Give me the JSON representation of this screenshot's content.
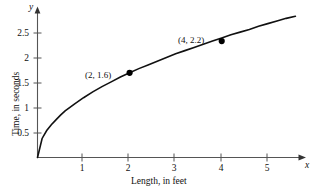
{
  "chart_data": {
    "type": "line",
    "title": "",
    "subtitle": "",
    "xlabel": "Length, in feet",
    "ylabel": "Time, in seconds",
    "x_axis_name": "x",
    "y_axis_name": "y",
    "xlim": [
      0,
      5.7
    ],
    "ylim": [
      0,
      2.75
    ],
    "grid": false,
    "legend": false,
    "xticks": [
      1,
      2,
      3,
      4,
      5
    ],
    "xtick_labels": [
      "1",
      "2",
      "3",
      "4",
      "5"
    ],
    "yticks": [
      0.5,
      1,
      1.5,
      2,
      2.5
    ],
    "ytick_labels": [
      "0.5",
      "1",
      "1.5",
      "2",
      "2.5"
    ],
    "curve": {
      "name": "period of pendulum",
      "relation": "y = 1.13 * sqrt(x)",
      "coefficient": 1.13,
      "x_start": 0,
      "x_end": 5.6,
      "x": [
        0,
        0.1,
        0.2,
        0.3,
        0.4,
        0.5,
        0.6,
        0.8,
        1,
        1.2,
        1.4,
        1.6,
        1.8,
        2,
        2.2,
        2.4,
        2.6,
        2.8,
        3,
        3.2,
        3.4,
        3.6,
        3.8,
        4,
        4.2,
        4.4,
        4.6,
        4.8,
        5,
        5.2,
        5.4,
        5.6
      ],
      "y": [
        0,
        0.36,
        0.51,
        0.62,
        0.71,
        0.8,
        0.88,
        1.01,
        1.13,
        1.24,
        1.34,
        1.43,
        1.52,
        1.6,
        1.68,
        1.75,
        1.82,
        1.89,
        1.96,
        2.02,
        2.08,
        2.14,
        2.2,
        2.26,
        2.32,
        2.37,
        2.42,
        2.48,
        2.53,
        2.58,
        2.63,
        2.67
      ]
    },
    "points": [
      {
        "x": 2,
        "y": 1.6,
        "label": "(2, 1.6)",
        "label_position": "upper-left"
      },
      {
        "x": 4,
        "y": 2.2,
        "label": "(4, 2.2)",
        "label_position": "upper-left"
      }
    ],
    "colors": {
      "curve": "#111111",
      "axis": "#444444",
      "marker": "#000000",
      "background": "#ffffff"
    }
  }
}
